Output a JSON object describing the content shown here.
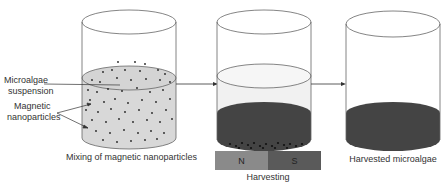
{
  "diagram": {
    "stages": [
      {
        "id": "mixing",
        "caption": "Mixing of magnetic nanoparticles"
      },
      {
        "id": "harvesting",
        "caption": "Harvesting"
      },
      {
        "id": "harvested",
        "caption": "Harvested microalgae"
      }
    ],
    "labels": {
      "suspension_line1": "Microalgae",
      "suspension_line2": "suspension",
      "particles_line1": "Magnetic",
      "particles_line2": "nanoparticles"
    },
    "magnet": {
      "north": "N",
      "south": "S"
    },
    "colors": {
      "suspension": "#d8d8d8",
      "dark_algae": "#444444",
      "magnet_n": "#8a8a8a",
      "magnet_s": "#5a5a5a",
      "outline": "#666666"
    }
  }
}
